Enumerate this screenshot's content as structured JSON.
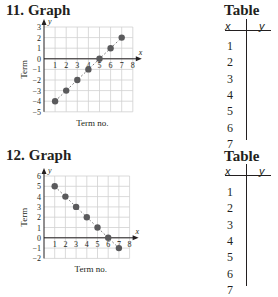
{
  "problems": [
    {
      "number": "11.",
      "label": "Graph",
      "table_title": "Table",
      "table_headers": [
        "x",
        "y"
      ],
      "table_rows": [
        "1",
        "2",
        "3",
        "4",
        "5",
        "6",
        "7"
      ]
    },
    {
      "number": "12.",
      "label": "Graph",
      "table_title": "Table",
      "table_headers": [
        "x",
        "y"
      ],
      "table_rows": [
        "1",
        "2",
        "3",
        "4",
        "5",
        "6",
        "7"
      ]
    }
  ],
  "chart_data": [
    {
      "type": "scatter",
      "title": "11. Graph",
      "xlabel": "Term no.",
      "ylabel": "Term",
      "x_axis_letter": "x",
      "y_axis_letter": "y",
      "xlim": [
        0,
        8
      ],
      "ylim": [
        -5,
        3
      ],
      "x_ticks": [
        1,
        2,
        3,
        4,
        5,
        6,
        7,
        8
      ],
      "y_ticks": [
        3,
        2,
        1,
        0,
        -1,
        -2,
        -3,
        -4,
        -5
      ],
      "grid": true,
      "dashed_trend_line": true,
      "x": [
        1,
        2,
        3,
        4,
        5,
        6,
        7
      ],
      "y": [
        -4,
        -3,
        -2,
        -1,
        0,
        1,
        2
      ]
    },
    {
      "type": "scatter",
      "title": "12. Graph",
      "xlabel": "Term no.",
      "ylabel": "Term",
      "x_axis_letter": "x",
      "y_axis_letter": "y",
      "xlim": [
        0,
        8
      ],
      "ylim": [
        -2,
        6
      ],
      "x_ticks": [
        1,
        2,
        3,
        4,
        5,
        6,
        7,
        8
      ],
      "y_ticks": [
        6,
        5,
        4,
        3,
        2,
        1,
        0,
        -1,
        -2
      ],
      "grid": true,
      "dashed_trend_line": true,
      "x": [
        1,
        2,
        3,
        4,
        5,
        6,
        7
      ],
      "y": [
        5,
        4,
        3,
        2,
        1,
        0,
        -1
      ]
    }
  ],
  "colors": {
    "point": "#5a5a5c",
    "grid": "#d0d0d0",
    "axis": "#231f20",
    "trend": "#808080"
  }
}
